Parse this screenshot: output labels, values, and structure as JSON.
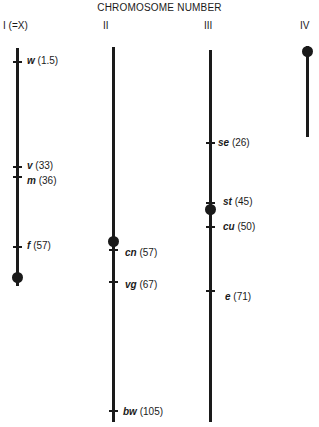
{
  "title": "CHROMOSOME NUMBER",
  "chromosomes": [
    {
      "label": "I  (=X)",
      "genes": [
        {
          "symbol": "w",
          "pos": "(1.5)"
        },
        {
          "symbol": "v",
          "pos": "(33)"
        },
        {
          "symbol": "m",
          "pos": "(36)"
        },
        {
          "symbol": "f",
          "pos": "(57)"
        }
      ]
    },
    {
      "label": "II",
      "genes": [
        {
          "symbol": "cn",
          "pos": "(57)"
        },
        {
          "symbol": "vg",
          "pos": "(67)"
        },
        {
          "symbol": "bw",
          "pos": "(105)"
        }
      ]
    },
    {
      "label": "III",
      "genes": [
        {
          "symbol": "se",
          "pos": "(26)"
        },
        {
          "symbol": "st",
          "pos": "(45)"
        },
        {
          "symbol": "cu",
          "pos": "(50)"
        },
        {
          "symbol": "e",
          "pos": "(71)"
        }
      ]
    },
    {
      "label": "IV",
      "genes": []
    }
  ]
}
